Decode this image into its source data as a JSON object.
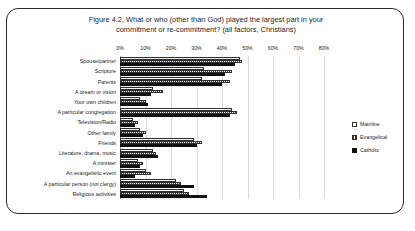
{
  "figure": {
    "title_line1": "Figure 4.2, What or who (other than God) played the largest part in your",
    "title_line2": "commitment or re-commitment? (all factors, Christians)"
  },
  "chart_data": {
    "type": "bar",
    "orientation": "horizontal",
    "title": "Figure 4.2, What or who (other than God) played the largest part in your commitment or re-commitment? (all factors, Christians)",
    "xlabel": "",
    "ylabel": "",
    "xlim": [
      0,
      80
    ],
    "xticks": [
      0,
      10,
      20,
      30,
      40,
      50,
      60,
      70,
      80
    ],
    "xtick_labels": [
      "0%",
      "10%",
      "20%",
      "30%",
      "40%",
      "50%",
      "60%",
      "70%",
      "80%"
    ],
    "grid": true,
    "legend_position": "right",
    "categories": [
      "Spouse/partner",
      "Scripture",
      "Parents",
      "A dream or vision",
      "Your own children",
      "A particular congregation",
      "Television/Radio",
      "Other family",
      "Friends",
      "Literature, drama, music",
      "A minister",
      "An evangelistic event",
      "A particular person (not clergy)",
      "Religious activities"
    ],
    "series": [
      {
        "name": "Mainline",
        "fill": "hollow",
        "values": [
          47,
          33,
          32,
          13,
          8,
          44,
          5,
          8,
          29,
          13,
          7,
          10,
          22,
          25
        ]
      },
      {
        "name": "Evangelical",
        "fill": "hatched",
        "values": [
          48,
          44,
          43,
          17,
          10,
          46,
          7,
          10,
          32,
          14,
          9,
          12,
          24,
          27
        ]
      },
      {
        "name": "Catholic",
        "fill": "solid",
        "values": [
          45,
          41,
          40,
          12,
          11,
          43,
          6,
          9,
          30,
          15,
          8,
          6,
          29,
          34
        ]
      }
    ]
  },
  "legend": {
    "items": [
      {
        "label": "Mainline",
        "swatch": "hollow-square-icon"
      },
      {
        "label": "Evangelical",
        "swatch": "hatched-square-icon"
      },
      {
        "label": "Catholic",
        "swatch": "filled-square-icon"
      }
    ]
  }
}
